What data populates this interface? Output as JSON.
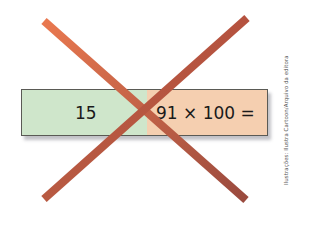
{
  "card": {
    "left_text": "15",
    "right_text": "91 × 100 =",
    "left_color": "#cfe6cb",
    "right_color": "#f5cfb0"
  },
  "cross_mark": {
    "icon": "x-cross-icon",
    "color": "#c8553d"
  },
  "credit": "Ilustrações: Ilustra Cartoon/Arquivo da editora"
}
